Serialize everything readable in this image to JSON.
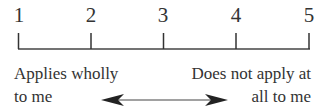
{
  "scale": {
    "points": [
      "1",
      "2",
      "3",
      "4",
      "5"
    ],
    "left_anchor": {
      "line1": "Applies wholly",
      "line2": "to me"
    },
    "right_anchor": {
      "line1": "Does not apply at",
      "line2": "all to me"
    },
    "arrow": "bidirectional"
  }
}
